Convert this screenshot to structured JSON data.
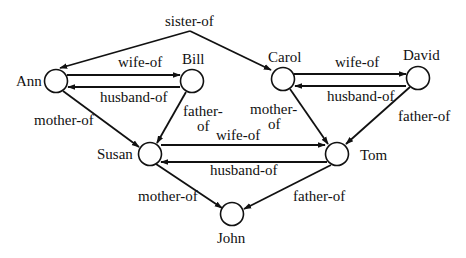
{
  "diagram": {
    "type": "family-relations-graph",
    "nodes": [
      {
        "id": "ann",
        "label": "Ann",
        "cx": 56,
        "cy": 81,
        "lx": 16,
        "ly": 86
      },
      {
        "id": "bill",
        "label": "Bill",
        "cx": 192,
        "cy": 81,
        "lx": 182,
        "ly": 64
      },
      {
        "id": "carol",
        "label": "Carol",
        "cx": 283,
        "cy": 79,
        "lx": 268,
        "ly": 62
      },
      {
        "id": "david",
        "label": "David",
        "cx": 418,
        "cy": 78,
        "lx": 403,
        "ly": 60
      },
      {
        "id": "susan",
        "label": "Susan",
        "cx": 150,
        "cy": 154,
        "lx": 97,
        "ly": 159
      },
      {
        "id": "tom",
        "label": "Tom",
        "cx": 337,
        "cy": 154,
        "lx": 360,
        "ly": 160
      },
      {
        "id": "john",
        "label": "John",
        "cx": 232,
        "cy": 214,
        "lx": 217,
        "ly": 243
      }
    ],
    "edges": [
      {
        "from": "apex",
        "to": "ann",
        "label": "sister-of"
      },
      {
        "from": "apex",
        "to": "carol",
        "label": "sister-of"
      },
      {
        "from": "ann",
        "to": "bill",
        "label": "wife-of"
      },
      {
        "from": "bill",
        "to": "ann",
        "label": "husband-of"
      },
      {
        "from": "carol",
        "to": "david",
        "label": "wife-of"
      },
      {
        "from": "david",
        "to": "carol",
        "label": "husband-of"
      },
      {
        "from": "ann",
        "to": "susan",
        "label": "mother-of"
      },
      {
        "from": "bill",
        "to": "susan",
        "label": "father-of"
      },
      {
        "from": "carol",
        "to": "tom",
        "label": "mother-of"
      },
      {
        "from": "david",
        "to": "tom",
        "label": "father-of"
      },
      {
        "from": "susan",
        "to": "tom",
        "label": "wife-of"
      },
      {
        "from": "tom",
        "to": "susan",
        "label": "husband-of"
      },
      {
        "from": "susan",
        "to": "john",
        "label": "mother-of"
      },
      {
        "from": "tom",
        "to": "john",
        "label": "father-of"
      }
    ],
    "labels": {
      "sister_of": "sister-of",
      "ann_bill_wife": "wife-of",
      "bill_ann_husband": "husband-of",
      "carol_david_wife": "wife-of",
      "david_carol_husband": "husband-of",
      "ann_susan_mother": "mother-of",
      "bill_susan_father_1": "father-",
      "bill_susan_father_2": "of",
      "carol_tom_mother_1": "mother-",
      "carol_tom_mother_2": "of",
      "david_tom_father": "father-of",
      "susan_tom_wife": "wife-of",
      "tom_susan_husband": "husband-of",
      "susan_john_mother": "mother-of",
      "tom_john_father": "father-of"
    },
    "colors": {
      "ink": "#111111",
      "background": "#ffffff"
    }
  }
}
